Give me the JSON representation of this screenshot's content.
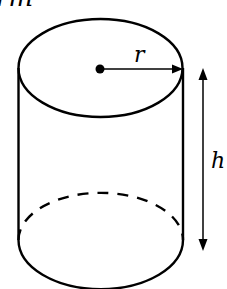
{
  "diagram": {
    "labels": {
      "top_partial": "rm",
      "radius": "r",
      "height": "h"
    },
    "colors": {
      "stroke": "#000000",
      "background": "#ffffff"
    }
  }
}
